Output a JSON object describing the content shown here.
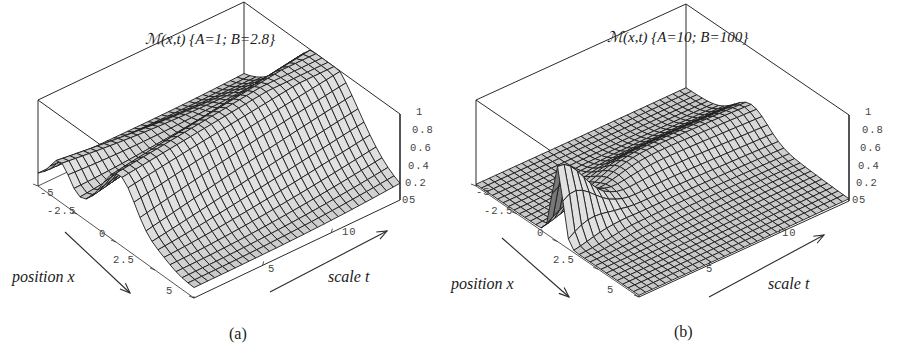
{
  "chart_data": [
    {
      "type": "surface3d",
      "panel": "(a)",
      "title": "ℳ(x,t) {A=1; B=2.8}",
      "params": {
        "A": 1,
        "B": 2.8
      },
      "xlabel": "position x",
      "ylabel": "scale t",
      "zlabel": "",
      "x_ticks": [
        "-5",
        "-2.5",
        "0",
        "2.5",
        "5"
      ],
      "t_ticks": [
        "5",
        "10"
      ],
      "z_ticks": [
        "0",
        "0.2",
        "0.4",
        "0.6",
        "0.8",
        "1"
      ],
      "xlim": [
        -5,
        5
      ],
      "tlim": [
        0,
        15
      ],
      "zlim": [
        0,
        1
      ],
      "description": "Broad ridge near x≈0 across all scales rising to ~1; secondary lower ridge near x≈-3.5 at small scales; surface falls to ~0.1-0.2 at large |x|"
    },
    {
      "type": "surface3d",
      "panel": "(b)",
      "title": "ℳ(x,t) {A=10; B=100}",
      "params": {
        "A": 10,
        "B": 100
      },
      "xlabel": "position x",
      "ylabel": "scale t",
      "zlabel": "",
      "x_ticks": [
        "-5",
        "-2.5",
        "0",
        "2.5",
        "5"
      ],
      "t_ticks": [
        "5",
        "10"
      ],
      "z_ticks": [
        "0",
        "0.2",
        "0.4",
        "0.6",
        "0.8",
        "1"
      ],
      "xlim": [
        -5,
        5
      ],
      "tlim": [
        0,
        15
      ],
      "zlim": [
        0,
        1
      ],
      "description": "Sharp narrow peak near x≈0 at small scale t (height ~0.9); low plateau ~0.3 across larger scales; surface near 0 elsewhere"
    }
  ],
  "panels": {
    "a": {
      "title": "ℳ(x,t) {A=1; B=2.8}",
      "caption": "(a)",
      "xlabel": "position  x",
      "ylabel": "scale  t",
      "x_ticks": [
        "-5",
        "-2.5",
        "0",
        "2.5",
        "5"
      ],
      "t_ticks": [
        "5",
        "10"
      ],
      "z_ticks": [
        "1",
        "0.8",
        "0.6",
        "0.4",
        "0.2",
        "0",
        "5"
      ]
    },
    "b": {
      "title": "ℳ(x,t) {A=10; B=100}",
      "caption": "(b)",
      "xlabel": "position  x",
      "ylabel": "scale  t",
      "x_ticks": [
        "-5",
        "-2.5",
        "0",
        "2.5",
        "5"
      ],
      "t_ticks": [
        "5",
        "10"
      ],
      "z_ticks": [
        "1",
        "0.8",
        "0.6",
        "0.4",
        "0.2",
        "0",
        "5"
      ]
    }
  }
}
